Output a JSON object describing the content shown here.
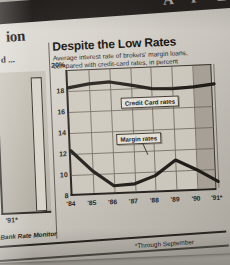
{
  "masthead": {
    "letters": "A P E R"
  },
  "section_heading": "ion",
  "left_panel": {
    "title": "d ...",
    "xlabel": "'91*"
  },
  "chart": {
    "title": "Despite the Low Rates",
    "subtitle": "Average interest rate of brokers' margin loans, compared with credit-card rates, in percent",
    "ylabel_top": "20%",
    "source": "Bank Rate Monitor",
    "footnote": "*Through September"
  },
  "chart_data": {
    "type": "line",
    "title": "Despite the Low Rates",
    "subtitle": "Average interest rate of brokers' margin loans, compared with credit-card rates, in percent",
    "xlabel": "",
    "ylabel": "percent",
    "x": [
      "'84",
      "'85",
      "'86",
      "'87",
      "'88",
      "'89",
      "'90",
      "'91*"
    ],
    "ylim": [
      8,
      20
    ],
    "yticks": [
      8,
      10,
      12,
      14,
      16,
      18,
      20
    ],
    "ytick_labels": [
      "8",
      "10",
      "12",
      "14",
      "16",
      "18",
      "20%"
    ],
    "grid": true,
    "legend": "inline-callouts",
    "shaded_region": {
      "from": "'90",
      "to": "'91*",
      "note": "final period shaded"
    },
    "series": [
      {
        "name": "Credit Card rates",
        "values": [
          18.3,
          18.6,
          18.7,
          18.3,
          17.9,
          17.8,
          17.9,
          18.1
        ]
      },
      {
        "name": "Margin rates",
        "values": [
          12.3,
          10.3,
          8.8,
          8.9,
          9.6,
          11.0,
          10.0,
          8.8
        ]
      }
    ],
    "annotations": [
      {
        "text": "Credit Card rates",
        "series": "Credit Card rates"
      },
      {
        "text": "Margin rates",
        "series": "Margin rates"
      }
    ],
    "source": "Bank Rate Monitor",
    "footnote": "*Through September"
  }
}
